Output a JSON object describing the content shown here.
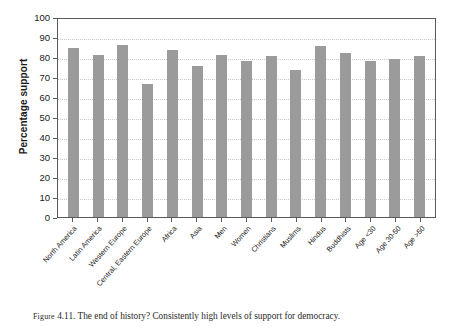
{
  "figure": {
    "caption_prefix": "Figure",
    "caption_number": "4.11.",
    "caption_text": "The end of history? Consistently high levels of support for democracy."
  },
  "chart_data": {
    "type": "bar",
    "title": "",
    "xlabel": "",
    "ylabel": "Percentage support",
    "ylim": [
      0,
      100
    ],
    "ytick_step": 10,
    "yticks": [
      100,
      90,
      80,
      70,
      60,
      50,
      40,
      30,
      20,
      10,
      0
    ],
    "grid": true,
    "legend": "none",
    "bar_color": "#9b9b9b",
    "axis_color": "#5a5a5a",
    "gridline_color": "#c9c9c9",
    "categories": [
      "North America",
      "Latin America",
      "Western Europe",
      "Central, Eastern Europe",
      "Africa",
      "Asia",
      "Men",
      "Women",
      "Christians",
      "Muslims",
      "Hindus",
      "Buddhists",
      "Age <30",
      "Age 30-50",
      "Age >50"
    ],
    "values": [
      84.5,
      81,
      86,
      66.5,
      83.5,
      75.5,
      81,
      78,
      80.5,
      73.5,
      85.5,
      82,
      78,
      79,
      80.5
    ]
  }
}
